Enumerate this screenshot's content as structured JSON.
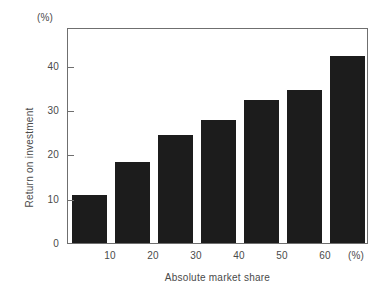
{
  "chart_data": {
    "type": "bar",
    "title": "",
    "subtitle": "",
    "xlabel": "Absolute market share",
    "ylabel": "Return on investment",
    "x_unit_label": "(%)",
    "y_unit_label": "(%)",
    "categories": [
      "10",
      "20",
      "30",
      "40",
      "50",
      "60",
      "70"
    ],
    "values": [
      10.8,
      18.2,
      24.5,
      27.8,
      32.2,
      34.5,
      42.2
    ],
    "x_tick_labels": [
      "10",
      "20",
      "30",
      "40",
      "50",
      "60"
    ],
    "y_tick_labels": [
      "0",
      "10",
      "20",
      "30",
      "40"
    ],
    "y_tick_values": [
      0,
      10,
      20,
      30,
      40
    ],
    "ylim": [
      0,
      48.8
    ],
    "xlim": [
      5,
      75
    ],
    "grid": false,
    "legend": "none",
    "bar_color": "#1c1c1c",
    "axis_color": "#6f6f6f",
    "text_color": "#4a4a4a",
    "background": "#ffffff"
  }
}
